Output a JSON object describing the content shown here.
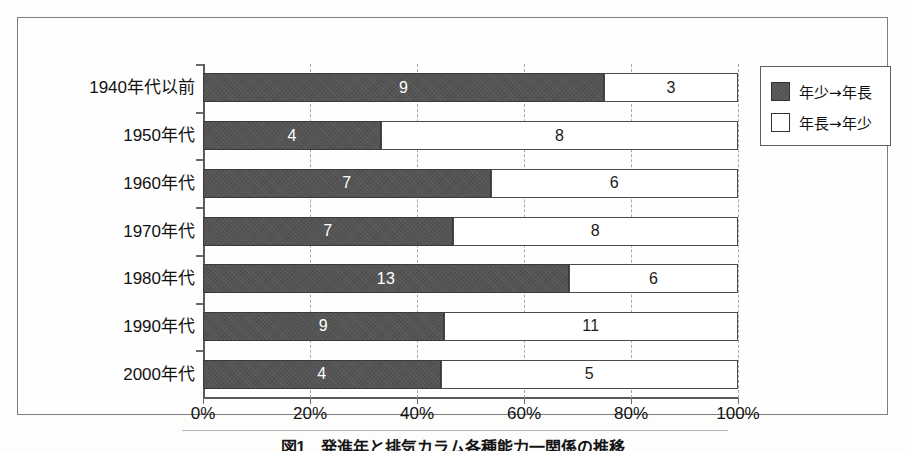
{
  "figure": {
    "caption": "図1　発進年と排気カラム各種能力一関係の推移"
  },
  "chart_data": {
    "type": "bar",
    "orientation": "horizontal",
    "stacked": true,
    "normalized": true,
    "title": "",
    "xlabel": "",
    "ylabel": "",
    "xlim": [
      0,
      100
    ],
    "xticks": [
      "0%",
      "20%",
      "40%",
      "60%",
      "80%",
      "100%"
    ],
    "xtick_values": [
      0,
      20,
      40,
      60,
      80,
      100
    ],
    "grid": "vertical-dashed",
    "legend_position": "right-top",
    "categories": [
      "1940年代以前",
      "1950年代",
      "1960年代",
      "1970年代",
      "1980年代",
      "1990年代",
      "2000年代"
    ],
    "series": [
      {
        "name": "年少→年長",
        "color": "#545454",
        "values": [
          9,
          4,
          7,
          7,
          13,
          9,
          4
        ]
      },
      {
        "name": "年長→年少",
        "color": "#ffffff",
        "values": [
          3,
          8,
          6,
          8,
          6,
          11,
          5
        ]
      }
    ],
    "rows": [
      {
        "category": "1940年代以前",
        "dark_value": 9,
        "light_value": 3,
        "total": 12,
        "dark_pct": 75.0,
        "light_pct": 25.0
      },
      {
        "category": "1950年代",
        "dark_value": 4,
        "light_value": 8,
        "total": 12,
        "dark_pct": 33.3,
        "light_pct": 66.7
      },
      {
        "category": "1960年代",
        "dark_value": 7,
        "light_value": 6,
        "total": 13,
        "dark_pct": 53.8,
        "light_pct": 46.2
      },
      {
        "category": "1970年代",
        "dark_value": 7,
        "light_value": 8,
        "total": 15,
        "dark_pct": 46.7,
        "light_pct": 53.3
      },
      {
        "category": "1980年代",
        "dark_value": 13,
        "light_value": 6,
        "total": 19,
        "dark_pct": 68.4,
        "light_pct": 31.6
      },
      {
        "category": "1990年代",
        "dark_value": 9,
        "light_value": 11,
        "total": 20,
        "dark_pct": 45.0,
        "light_pct": 55.0
      },
      {
        "category": "2000年代",
        "dark_value": 4,
        "light_value": 5,
        "total": 9,
        "dark_pct": 44.4,
        "light_pct": 55.6
      }
    ]
  },
  "legend": {
    "items": [
      {
        "label": "年少→年長",
        "swatch": "dark"
      },
      {
        "label": "年長→年少",
        "swatch": "light"
      }
    ]
  }
}
